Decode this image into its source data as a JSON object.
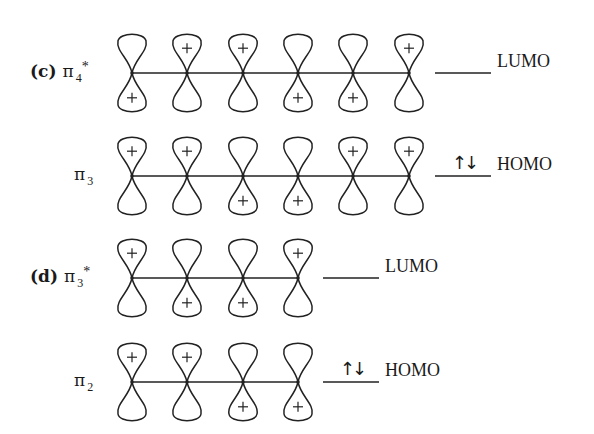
{
  "figure": {
    "stroke_color": "#222222",
    "background": "#ffffff",
    "lobe": {
      "half_width": 14,
      "height": 40
    },
    "rows": [
      {
        "id": "c-pi4-star",
        "part_label": "(c)",
        "orbital_symbol": "π",
        "orbital_subscript": "4",
        "orbital_superscript": "*",
        "center_y": 73,
        "node_x": [
          132,
          187,
          243,
          298,
          353,
          409
        ],
        "plus_positions": [
          "bottom",
          "top",
          "top",
          "bottom",
          "bottom",
          "top"
        ],
        "level": {
          "x1": 435,
          "x2": 491,
          "label": "LUMO",
          "electrons": ""
        }
      },
      {
        "id": "c-pi3",
        "part_label": "",
        "orbital_symbol": "π",
        "orbital_subscript": "3",
        "orbital_superscript": "",
        "center_y": 176,
        "node_x": [
          132,
          187,
          243,
          298,
          353,
          409
        ],
        "plus_positions": [
          "top",
          "top",
          "bottom",
          "bottom",
          "top",
          "top"
        ],
        "level": {
          "x1": 435,
          "x2": 491,
          "label": "HOMO",
          "electrons": "↑↓"
        }
      },
      {
        "id": "d-pi3-star",
        "part_label": "(d)",
        "orbital_symbol": "π",
        "orbital_subscript": "3",
        "orbital_superscript": "*",
        "center_y": 278,
        "node_x": [
          132,
          187,
          243,
          298
        ],
        "plus_positions": [
          "top",
          "bottom",
          "bottom",
          "top"
        ],
        "level": {
          "x1": 323,
          "x2": 379,
          "label": "LUMO",
          "electrons": ""
        }
      },
      {
        "id": "d-pi2",
        "part_label": "",
        "orbital_symbol": "π",
        "orbital_subscript": "2",
        "orbital_superscript": "",
        "center_y": 382,
        "node_x": [
          132,
          187,
          243,
          298
        ],
        "plus_positions": [
          "top",
          "top",
          "bottom",
          "bottom"
        ],
        "level": {
          "x1": 323,
          "x2": 379,
          "label": "HOMO",
          "electrons": "↑↓"
        }
      }
    ]
  }
}
